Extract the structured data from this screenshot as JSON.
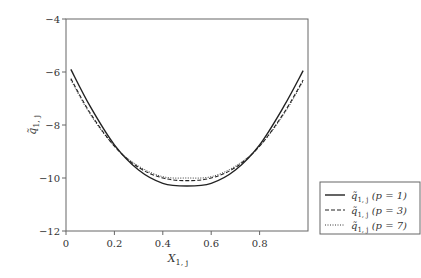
{
  "chart_data": {
    "type": "line",
    "title": "",
    "xlabel": "X_{1,j}",
    "ylabel": "q̃_{1,j}",
    "xlim": [
      0,
      1.0
    ],
    "ylim": [
      -12,
      -4
    ],
    "xticks": [
      0,
      0.2,
      0.4,
      0.6,
      0.8
    ],
    "xtick_labels": [
      "0",
      "0.2",
      "0.4",
      "0.6",
      "0.8"
    ],
    "yticks": [
      -4,
      -6,
      -8,
      -10,
      -12
    ],
    "ytick_labels": [
      "-4",
      "-6",
      "-8",
      "-10",
      "-12"
    ],
    "grid": false,
    "legend_position": "right-bottom-outside",
    "x": [
      0.02,
      0.1,
      0.2,
      0.3,
      0.4,
      0.5,
      0.6,
      0.7,
      0.8,
      0.9,
      0.98
    ],
    "series": [
      {
        "name": "q̃1,j (p = 1)",
        "style": "solid",
        "values": [
          -5.9,
          -7.3,
          -8.75,
          -9.7,
          -10.2,
          -10.3,
          -10.2,
          -9.7,
          -8.75,
          -7.3,
          -5.95
        ]
      },
      {
        "name": "q̃1,j (p = 3)",
        "style": "dashed",
        "values": [
          -6.25,
          -7.55,
          -8.8,
          -9.6,
          -10.0,
          -10.1,
          -10.0,
          -9.6,
          -8.8,
          -7.55,
          -6.3
        ]
      },
      {
        "name": "q̃1,j (p = 7)",
        "style": "dotted",
        "values": [
          -6.3,
          -7.6,
          -8.8,
          -9.55,
          -9.95,
          -10.0,
          -9.95,
          -9.55,
          -8.8,
          -7.6,
          -6.35
        ]
      }
    ]
  },
  "legend": {
    "items": [
      {
        "label_base": "q̃",
        "label_sub": "1, j",
        "label_param": "(p = 1)"
      },
      {
        "label_base": "q̃",
        "label_sub": "1, j",
        "label_param": "(p = 3)"
      },
      {
        "label_base": "q̃",
        "label_sub": "1, j",
        "label_param": "(p = 7)"
      }
    ]
  },
  "axes": {
    "xlabel_base": "X",
    "xlabel_sub": "1, j",
    "ylabel_base": "q̃",
    "ylabel_sub": "1, j"
  }
}
